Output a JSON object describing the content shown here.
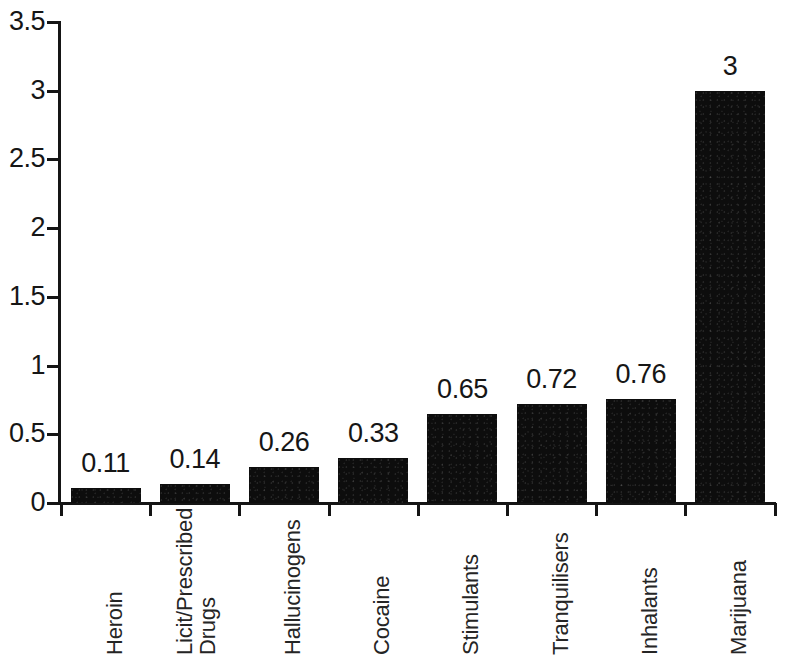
{
  "chart_data": {
    "type": "bar",
    "title": "",
    "subtitle": "",
    "xlabel": "",
    "ylabel": "",
    "categories": [
      "Heroin",
      "Licit/Prescribed Drugs",
      "Hallucinogens",
      "Cocaine",
      "Stimulants",
      "Tranquilisers",
      "Inhalants",
      "Marijuana"
    ],
    "category_lines": [
      [
        "Heroin"
      ],
      [
        "Licit/Prescribed",
        "Drugs"
      ],
      [
        "Hallucinogens"
      ],
      [
        "Cocaine"
      ],
      [
        "Stimulants"
      ],
      [
        "Tranquilisers"
      ],
      [
        "Inhalants"
      ],
      [
        "Marijuana"
      ]
    ],
    "values": [
      0.11,
      0.14,
      0.26,
      0.33,
      0.65,
      0.72,
      0.76,
      3
    ],
    "value_labels": [
      "0.11",
      "0.14",
      "0.26",
      "0.33",
      "0.65",
      "0.72",
      "0.76",
      "3"
    ],
    "ylim": [
      0,
      3.5
    ],
    "yticks": [
      0,
      0.5,
      1,
      1.5,
      2,
      2.5,
      3,
      3.5
    ],
    "ytick_labels": [
      "0",
      "0.5",
      "1",
      "1.5",
      "2",
      "2.5",
      "3",
      "3.5"
    ],
    "grid": false,
    "legend": false,
    "legend_position": "none",
    "bar_color": "#0d0d0d",
    "axis_color": "#151515",
    "text_color": "#161616",
    "background_color": "#ffffff"
  }
}
